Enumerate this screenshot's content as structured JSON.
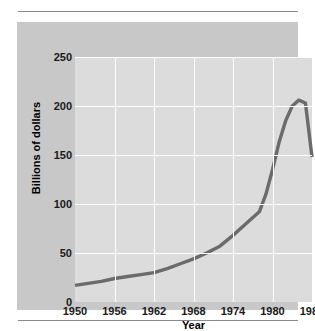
{
  "chart_data": {
    "type": "line",
    "title": "",
    "xlabel": "Year",
    "ylabel": "Billions of dollars",
    "xlim": [
      1950,
      1986
    ],
    "ylim": [
      0,
      250
    ],
    "xticks": [
      1950,
      1956,
      1962,
      1968,
      1974,
      1980,
      1986
    ],
    "xtick_labels": [
      "1950",
      "1956",
      "1962",
      "1968",
      "1974",
      "1980",
      "1986"
    ],
    "yticks": [
      0,
      50,
      100,
      150,
      200,
      250
    ],
    "ytick_labels": [
      "0",
      "50",
      "100",
      "150",
      "200",
      "250"
    ],
    "grid": "both",
    "legend": "none",
    "line_color": "#6b6b6b",
    "plot_background": "#dcdcdc",
    "panel_background": "#c8c8c8",
    "series": [
      {
        "name": "Billions of dollars",
        "x": [
          1950,
          1952,
          1954,
          1956,
          1958,
          1960,
          1962,
          1964,
          1966,
          1968,
          1970,
          1972,
          1974,
          1976,
          1978,
          1979,
          1980,
          1981,
          1982,
          1983,
          1984,
          1985,
          1986
        ],
        "values": [
          17,
          19,
          21,
          24,
          26,
          28,
          30,
          34,
          39,
          44,
          50,
          57,
          68,
          80,
          92,
          110,
          135,
          163,
          185,
          200,
          206,
          203,
          148
        ]
      }
    ]
  }
}
